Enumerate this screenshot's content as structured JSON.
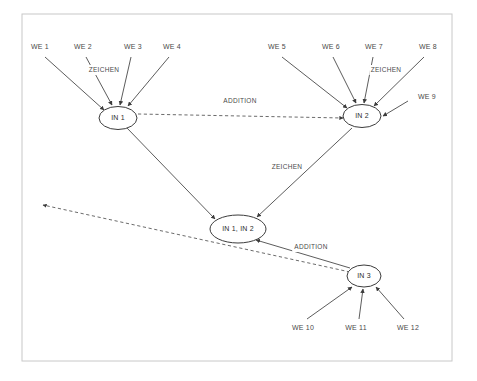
{
  "diagram": {
    "canvas": {
      "width": 477,
      "height": 381,
      "background": "#ffffff"
    },
    "frame": {
      "x": 22,
      "y": 14,
      "width": 430,
      "height": 347,
      "stroke": "#c8c8c8"
    },
    "colors": {
      "node_stroke": "#3c3c3c",
      "edge_solid": "#4a4a4a",
      "edge_dashed": "#5a5a5a",
      "text": "#3c3c3c",
      "frame": "#c8c8c8"
    },
    "nodes": [
      {
        "id": "in1",
        "label": "IN 1",
        "cx": 118,
        "cy": 118,
        "rx": 19,
        "ry": 11.5
      },
      {
        "id": "in2",
        "label": "IN 2",
        "cx": 362,
        "cy": 116,
        "rx": 19,
        "ry": 11.5
      },
      {
        "id": "in12",
        "label": "IN 1, IN 2",
        "cx": 238,
        "cy": 229,
        "rx": 28,
        "ry": 14
      },
      {
        "id": "in3",
        "label": "IN 3",
        "cx": 364,
        "cy": 276,
        "rx": 17,
        "ry": 11
      }
    ],
    "sources": [
      {
        "id": "we1",
        "label": "WE 1",
        "x": 40,
        "y": 47
      },
      {
        "id": "we2",
        "label": "WE 2",
        "x": 83,
        "y": 47
      },
      {
        "id": "we3",
        "label": "WE 3",
        "x": 133,
        "y": 47
      },
      {
        "id": "we4",
        "label": "WE 4",
        "x": 172,
        "y": 47
      },
      {
        "id": "we5",
        "label": "WE 5",
        "x": 277,
        "y": 47
      },
      {
        "id": "we6",
        "label": "WE 6",
        "x": 331,
        "y": 47
      },
      {
        "id": "we7",
        "label": "WE 7",
        "x": 374,
        "y": 47
      },
      {
        "id": "we8",
        "label": "WE 8",
        "x": 428,
        "y": 47
      },
      {
        "id": "we9",
        "label": "WE 9",
        "x": 427,
        "y": 97
      },
      {
        "id": "we10",
        "label": "WE 10",
        "x": 303,
        "y": 328
      },
      {
        "id": "we11",
        "label": "WE 11",
        "x": 356,
        "y": 328
      },
      {
        "id": "we12",
        "label": "WE 12",
        "x": 408,
        "y": 328
      }
    ],
    "edge_labels": [
      {
        "id": "zeichen-in1",
        "label": "ZEICHEN",
        "x": 104,
        "y": 70
      },
      {
        "id": "zeichen-in2",
        "label": "ZEICHEN",
        "x": 386,
        "y": 70
      },
      {
        "id": "addition-top",
        "label": "ADDITION",
        "x": 240,
        "y": 101
      },
      {
        "id": "zeichen-mid",
        "label": "ZEICHEN",
        "x": 287,
        "y": 167
      },
      {
        "id": "addition-bot",
        "label": "ADDITION",
        "x": 311,
        "y": 247
      }
    ],
    "edges": [
      {
        "id": "we1-in1",
        "from": "WE 1",
        "to": "IN 1",
        "style": "solid",
        "x1": 45,
        "y1": 57,
        "x2": 104,
        "y2": 110
      },
      {
        "id": "we2-in1",
        "from": "WE 2",
        "to": "IN 1",
        "style": "solid",
        "x1": 86,
        "y1": 57,
        "x2": 112,
        "y2": 105
      },
      {
        "id": "we3-in1",
        "from": "WE 3",
        "to": "IN 1",
        "style": "solid",
        "x1": 131,
        "y1": 57,
        "x2": 120,
        "y2": 105
      },
      {
        "id": "we4-in1",
        "from": "WE 4",
        "to": "IN 1",
        "style": "solid",
        "x1": 169,
        "y1": 57,
        "x2": 128,
        "y2": 106
      },
      {
        "id": "we5-in2",
        "from": "WE 5",
        "to": "IN 2",
        "style": "solid",
        "x1": 282,
        "y1": 57,
        "x2": 347,
        "y2": 108
      },
      {
        "id": "we6-in2",
        "from": "WE 6",
        "to": "IN 2",
        "style": "solid",
        "x1": 333,
        "y1": 57,
        "x2": 356,
        "y2": 103
      },
      {
        "id": "we7-in2",
        "from": "WE 7",
        "to": "IN 2",
        "style": "solid",
        "x1": 373,
        "y1": 57,
        "x2": 364,
        "y2": 103
      },
      {
        "id": "we8-in2",
        "from": "WE 8",
        "to": "IN 2",
        "style": "solid",
        "x1": 424,
        "y1": 57,
        "x2": 374,
        "y2": 106
      },
      {
        "id": "we9-in2",
        "from": "WE 9",
        "to": "IN 2",
        "style": "solid",
        "x1": 408,
        "y1": 101,
        "x2": 383,
        "y2": 116
      },
      {
        "id": "in1-in12",
        "from": "IN 1",
        "to": "IN 1, IN 2",
        "style": "solid",
        "x1": 127,
        "y1": 128,
        "x2": 215,
        "y2": 219
      },
      {
        "id": "in2-in12",
        "from": "IN 2",
        "to": "IN 1, IN 2",
        "style": "solid",
        "x1": 352,
        "y1": 128,
        "x2": 257,
        "y2": 217
      },
      {
        "id": "in3-in12",
        "from": "IN 3",
        "to": "IN 1, IN 2",
        "style": "solid",
        "x1": 350,
        "y1": 268,
        "x2": 256,
        "y2": 240
      },
      {
        "id": "we10-in3",
        "from": "WE 10",
        "to": "IN 3",
        "style": "solid",
        "x1": 307,
        "y1": 319,
        "x2": 352,
        "y2": 287
      },
      {
        "id": "we11-in3",
        "from": "WE 11",
        "to": "IN 3",
        "style": "solid",
        "x1": 359,
        "y1": 319,
        "x2": 363,
        "y2": 289
      },
      {
        "id": "we12-in3",
        "from": "WE 12",
        "to": "IN 3",
        "style": "solid",
        "x1": 404,
        "y1": 319,
        "x2": 376,
        "y2": 287
      },
      {
        "id": "in1-in2-addition",
        "from": "IN 1",
        "to": "IN 2",
        "style": "dashed",
        "x1": 138,
        "y1": 114,
        "x2": 343,
        "y2": 118
      },
      {
        "id": "in3-out-addition",
        "from": "IN 3",
        "to": "output",
        "style": "dashed",
        "x1": 350,
        "y1": 272,
        "x2": 43,
        "y2": 205
      }
    ]
  }
}
